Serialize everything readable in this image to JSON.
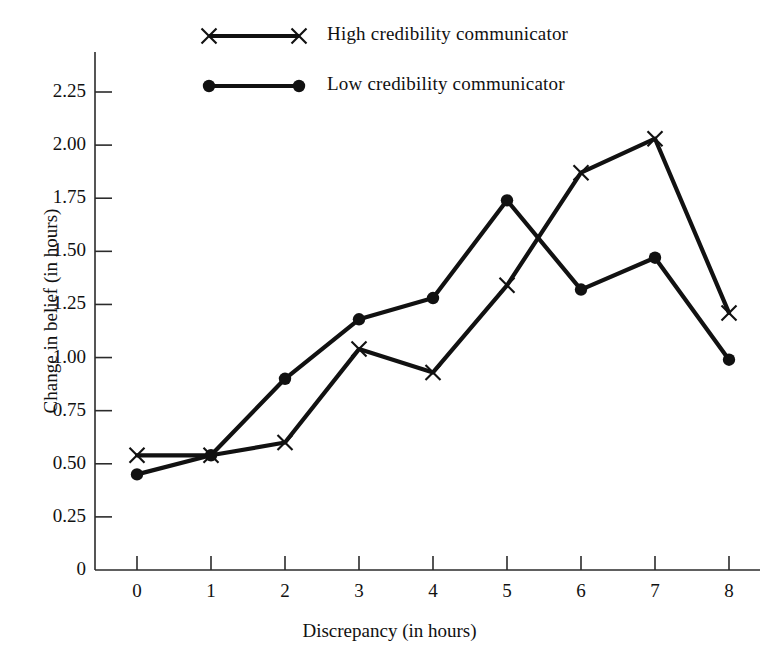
{
  "chart_data": {
    "type": "line",
    "title": "",
    "xlabel": "Discrepancy (in hours)",
    "ylabel": "Change in belief  (in hours)",
    "x": [
      0,
      1,
      2,
      3,
      4,
      5,
      6,
      7,
      8
    ],
    "xtick_labels": [
      "0",
      "1",
      "2",
      "3",
      "4",
      "5",
      "6",
      "7",
      "8"
    ],
    "ytick_labels": [
      "0",
      "0.25",
      "0.50",
      "0.75",
      "1.00",
      "1.25",
      "1.50",
      "1.75",
      "2.00",
      "2.25"
    ],
    "ytick_values": [
      0,
      0.25,
      0.5,
      0.75,
      1.0,
      1.25,
      1.5,
      1.75,
      2.0,
      2.25
    ],
    "xlim": [
      0,
      8
    ],
    "ylim": [
      0,
      2.25
    ],
    "grid": false,
    "legend_position": "top-center",
    "series": [
      {
        "name": "High credibility communicator",
        "marker": "x",
        "color": "#111111",
        "values": [
          0.54,
          0.54,
          0.6,
          1.04,
          0.93,
          1.34,
          1.87,
          2.03,
          1.21
        ]
      },
      {
        "name": "Low credibility communicator",
        "marker": "dot",
        "color": "#111111",
        "values": [
          0.45,
          0.54,
          0.9,
          1.18,
          1.28,
          1.74,
          1.32,
          1.47,
          0.99
        ]
      }
    ]
  },
  "legend": {
    "entries": [
      {
        "label": "High credibility communicator",
        "marker": "x"
      },
      {
        "label": "Low credibility communicator",
        "marker": "dot"
      }
    ]
  },
  "colors": {
    "ink": "#111111",
    "axis": "#2b2b2b",
    "background": "#ffffff"
  }
}
